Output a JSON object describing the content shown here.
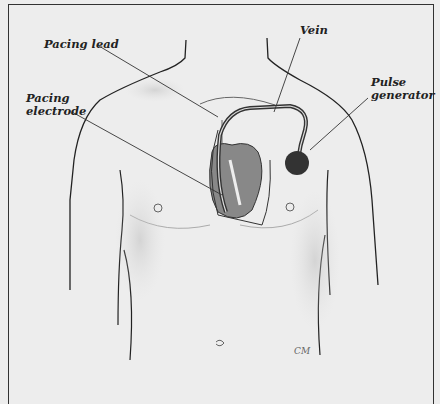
{
  "figure": {
    "labels": {
      "pacing_lead": "Pacing lead",
      "vein": "Vein",
      "pacing_electrode_line1": "Pacing",
      "pacing_electrode_line2": "electrode",
      "pulse_generator_line1": "Pulse",
      "pulse_generator_line2": "generator"
    },
    "signature": "CM"
  }
}
